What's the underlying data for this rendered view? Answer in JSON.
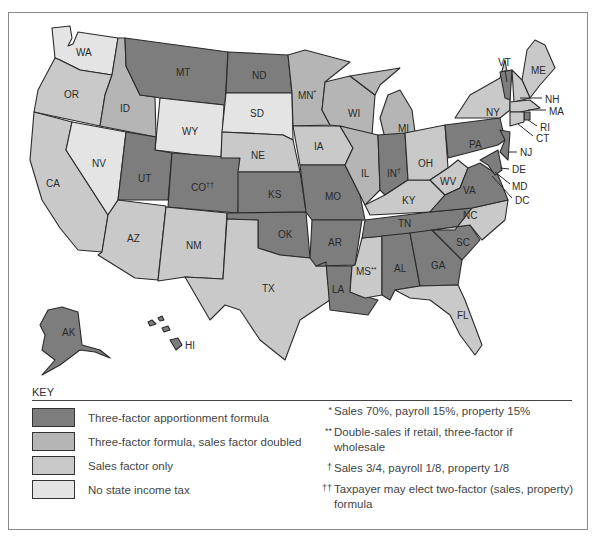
{
  "colors": {
    "three_factor": "#7d7d7d",
    "double_sales": "#b5b5b5",
    "sales_only": "#c9c9c9",
    "no_tax": "#e4e4e4"
  },
  "map": {
    "states": {
      "WA": "WA",
      "OR": "OR",
      "CA": "CA",
      "ID": "ID",
      "NV": "NV",
      "MT": "MT",
      "WY": "WY",
      "UT": "UT",
      "AZ": "AZ",
      "CO": "CO",
      "CO_mark": "††",
      "NM": "NM",
      "ND": "ND",
      "SD": "SD",
      "NE": "NE",
      "KS": "KS",
      "OK": "OK",
      "TX": "TX",
      "MN": "MN",
      "MN_mark": "*",
      "IA": "IA",
      "MO": "MO",
      "AR": "AR",
      "LA": "LA",
      "WI": "WI",
      "IL": "IL",
      "MS": "MS",
      "MS_mark": "**",
      "MI": "MI",
      "IN": "IN",
      "IN_mark": "†",
      "KY": "KY",
      "TN": "TN",
      "AL": "AL",
      "OH": "OH",
      "WV": "WV",
      "GA": "GA",
      "FL": "FL",
      "SC": "SC",
      "NC": "NC",
      "VA": "VA",
      "PA": "PA",
      "NY": "NY",
      "VT": "VT",
      "ME": "ME",
      "NH": "NH",
      "MA": "MA",
      "RI": "RI",
      "CT": "CT",
      "NJ": "NJ",
      "DE": "DE",
      "MD": "MD",
      "DC": "DC",
      "AK": "AK",
      "HI": "HI"
    }
  },
  "key": {
    "title": "KEY",
    "items": [
      {
        "label": "Three-factor apportionment formula"
      },
      {
        "label": "Three-factor formula, sales factor doubled"
      },
      {
        "label": "Sales factor only"
      },
      {
        "label": "No state income tax"
      }
    ],
    "notes": [
      {
        "mark": "*",
        "text": "Sales 70%, payroll 15%, property 15%"
      },
      {
        "mark": "**",
        "text": "Double-sales if retail, three-factor if wholesale"
      },
      {
        "mark": "†",
        "text": "Sales 3/4, payroll 1/8, property 1/8"
      },
      {
        "mark": "††",
        "text": "Taxpayer may elect two-factor (sales, property) formula"
      }
    ]
  }
}
